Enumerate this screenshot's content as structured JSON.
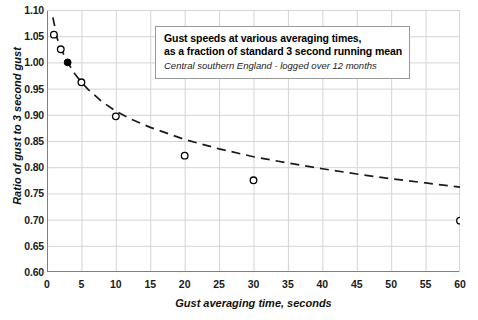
{
  "chart_data": {
    "type": "scatter",
    "title": "",
    "xlabel": "Gust averaging time, seconds",
    "ylabel": "Ratio of gust to 3 second gust",
    "xlim": [
      0,
      60
    ],
    "ylim": [
      0.6,
      1.1
    ],
    "xticks": [
      "0",
      "5",
      "10",
      "15",
      "20",
      "25",
      "30",
      "35",
      "40",
      "45",
      "50",
      "55",
      "60"
    ],
    "xtick_values": [
      0,
      5,
      10,
      15,
      20,
      25,
      30,
      35,
      40,
      45,
      50,
      55,
      60
    ],
    "yticks": [
      "0.60",
      "0.65",
      "0.70",
      "0.75",
      "0.80",
      "0.85",
      "0.90",
      "0.95",
      "1.00",
      "1.05",
      "1.10"
    ],
    "ytick_values": [
      0.6,
      0.65,
      0.7,
      0.75,
      0.8,
      0.85,
      0.9,
      0.95,
      1.0,
      1.05,
      1.1
    ],
    "grid": true,
    "legend": "none",
    "series": [
      {
        "name": "Measured gust ratio",
        "marker": "open-circle",
        "x": [
          1,
          2,
          5,
          10,
          20,
          30,
          60
        ],
        "values": [
          1.053,
          1.025,
          0.962,
          0.897,
          0.822,
          0.775,
          0.698
        ]
      },
      {
        "name": "Reference 3 second gust",
        "marker": "filled-circle",
        "x": [
          3
        ],
        "values": [
          1.0
        ]
      },
      {
        "name": "Fitted trend",
        "marker": "dashed-line",
        "x": [
          0.85,
          1.5,
          2,
          3,
          4,
          5,
          6,
          8,
          10,
          12,
          15,
          20,
          25,
          30,
          35,
          40,
          45,
          50,
          55,
          60
        ],
        "values": [
          1.086,
          1.045,
          1.027,
          1.0,
          0.979,
          0.962,
          0.948,
          0.925,
          0.907,
          0.893,
          0.876,
          0.853,
          0.835,
          0.82,
          0.808,
          0.797,
          0.787,
          0.778,
          0.77,
          0.762
        ]
      }
    ],
    "annotation": {
      "line1": "Gust speeds at various averaging times,",
      "line2": "as a fraction of standard 3 second running mean",
      "line3": "Central southern England - logged over 12 months"
    },
    "colors": {
      "grid": "#d4d4d4",
      "axis": "#808080",
      "marker": "#000000",
      "curve": "#1a1a1a",
      "note_border": "#9a9a9a"
    }
  }
}
